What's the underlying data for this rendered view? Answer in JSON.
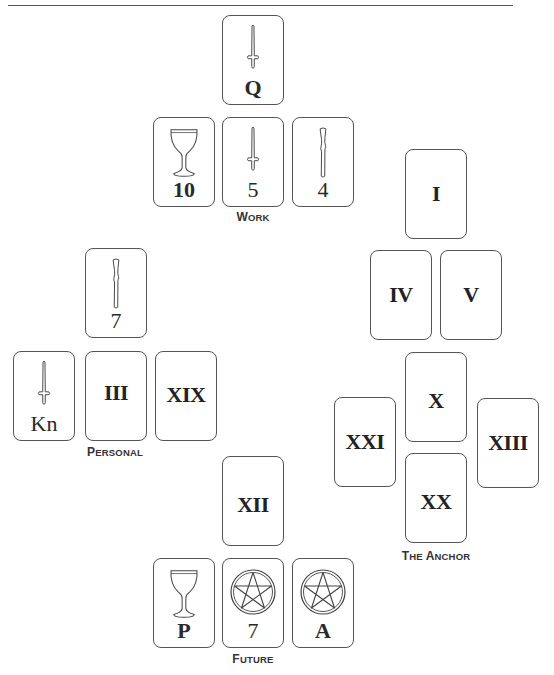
{
  "spreads": {
    "work": {
      "label_first": "W",
      "label_rest": "ork",
      "cards": [
        {
          "id": "q",
          "suit": "sword",
          "value": "Q"
        },
        {
          "id": "10",
          "suit": "cup",
          "value": "10"
        },
        {
          "id": "5",
          "suit": "sword",
          "value": "5"
        },
        {
          "id": "4",
          "suit": "wand",
          "value": "4"
        }
      ]
    },
    "personal": {
      "label_first": "P",
      "label_rest": "ersonal",
      "cards": [
        {
          "id": "7",
          "suit": "wand",
          "value": "7"
        },
        {
          "id": "kn",
          "suit": "sword",
          "value": "Kn"
        },
        {
          "id": "iii",
          "suit": "trump",
          "value": "III"
        },
        {
          "id": "xix",
          "suit": "trump",
          "value": "XIX"
        }
      ]
    },
    "anchor": {
      "label_first_1": "T",
      "label_rest_1": "he ",
      "label_first_2": "A",
      "label_rest_2": "nchor",
      "cards": [
        {
          "id": "i",
          "suit": "trump",
          "value": "I"
        },
        {
          "id": "iv",
          "suit": "trump",
          "value": "IV"
        },
        {
          "id": "v",
          "suit": "trump",
          "value": "V"
        },
        {
          "id": "x",
          "suit": "trump",
          "value": "X"
        },
        {
          "id": "xxi",
          "suit": "trump",
          "value": "XXI"
        },
        {
          "id": "xiii",
          "suit": "trump",
          "value": "XIII"
        },
        {
          "id": "xx",
          "suit": "trump",
          "value": "XX"
        }
      ]
    },
    "future": {
      "label_first": "F",
      "label_rest": "uture",
      "cards": [
        {
          "id": "xii",
          "suit": "trump",
          "value": "XII"
        },
        {
          "id": "p",
          "suit": "cup",
          "value": "P"
        },
        {
          "id": "7",
          "suit": "pentacle",
          "value": "7"
        },
        {
          "id": "a",
          "suit": "pentacle",
          "value": "A"
        }
      ]
    }
  }
}
